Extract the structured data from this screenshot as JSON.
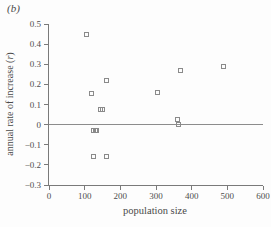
{
  "figure": {
    "panel_label": "(b)"
  },
  "chart_data": {
    "type": "scatter",
    "title": "",
    "xlabel": "population size",
    "ylabel": "annual rate of increase (r)",
    "ylabel_prefix": "annual rate of increase (",
    "ylabel_var": "r",
    "ylabel_suffix": ")",
    "xlim": [
      0,
      600
    ],
    "ylim": [
      -0.3,
      0.5
    ],
    "grid": false,
    "legend": null,
    "marker": "open-square",
    "refline_y": 0,
    "xticks": [
      {
        "v": 0,
        "label": "0"
      },
      {
        "v": 100,
        "label": "100"
      },
      {
        "v": 200,
        "label": "200"
      },
      {
        "v": 300,
        "label": "300"
      },
      {
        "v": 400,
        "label": "400"
      },
      {
        "v": 500,
        "label": "500"
      },
      {
        "v": 600,
        "label": "600"
      }
    ],
    "yticks": [
      {
        "v": 0.5,
        "label": "0.5"
      },
      {
        "v": 0.4,
        "label": "0.4"
      },
      {
        "v": 0.3,
        "label": "0.3"
      },
      {
        "v": 0.2,
        "label": "0.2"
      },
      {
        "v": 0.1,
        "label": "0.1"
      },
      {
        "v": 0,
        "label": "0"
      },
      {
        "v": -0.1,
        "label": "−0.1"
      },
      {
        "v": -0.2,
        "label": "−0.2"
      },
      {
        "v": -0.3,
        "label": "−0.3"
      }
    ],
    "points": [
      {
        "x": 105,
        "y": 0.45
      },
      {
        "x": 120,
        "y": 0.155
      },
      {
        "x": 160,
        "y": 0.22
      },
      {
        "x": 143,
        "y": 0.075
      },
      {
        "x": 151,
        "y": 0.075
      },
      {
        "x": 124,
        "y": -0.03
      },
      {
        "x": 129,
        "y": -0.03
      },
      {
        "x": 134,
        "y": -0.03
      },
      {
        "x": 125,
        "y": -0.16
      },
      {
        "x": 160,
        "y": -0.16
      },
      {
        "x": 305,
        "y": 0.16
      },
      {
        "x": 360,
        "y": 0.025
      },
      {
        "x": 362,
        "y": 0.0
      },
      {
        "x": 370,
        "y": 0.27
      },
      {
        "x": 490,
        "y": 0.29
      }
    ],
    "colors": {
      "marker_outline": "#8a8a8a",
      "axis": "#7a7a7a",
      "refline": "#8c8c8c",
      "text": "#4a4a4a",
      "background": "#fdfdfd"
    }
  }
}
